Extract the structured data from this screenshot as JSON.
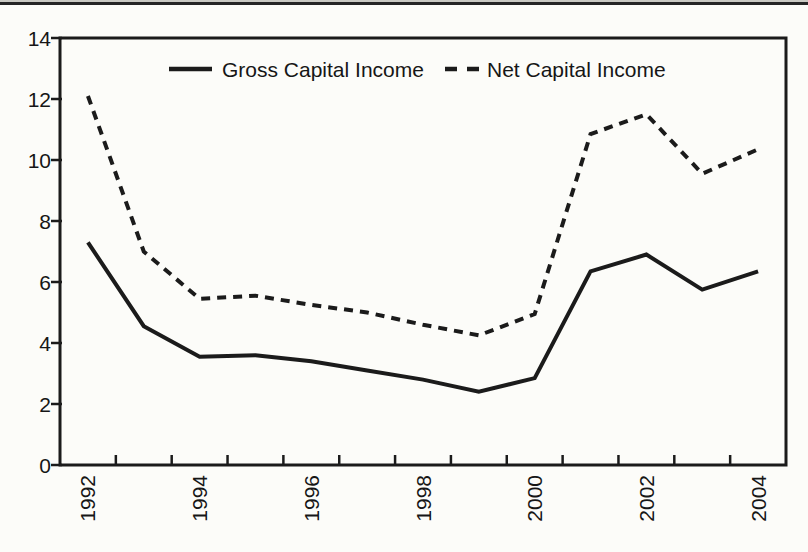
{
  "page": {
    "background": "#fcfcf9",
    "top_rule_color": "#262626"
  },
  "chart_data": {
    "type": "line",
    "title": "",
    "xlabel": "",
    "ylabel": "",
    "categories": [
      1992,
      1993,
      1994,
      1995,
      1996,
      1997,
      1998,
      1999,
      2000,
      2001,
      2002,
      2003,
      2004
    ],
    "series": [
      {
        "name": "Gross Capital Income",
        "style": "solid",
        "values": [
          7.3,
          4.55,
          3.55,
          3.6,
          3.4,
          3.1,
          2.8,
          2.4,
          2.85,
          6.35,
          6.9,
          5.75,
          6.35
        ]
      },
      {
        "name": "Net Capital Income",
        "style": "dashed",
        "values": [
          12.1,
          7.0,
          5.45,
          5.55,
          5.25,
          5.0,
          4.6,
          4.25,
          4.95,
          10.85,
          11.5,
          9.55,
          10.35
        ]
      }
    ],
    "ylim": [
      0,
      14
    ],
    "yticks": [
      0,
      2,
      4,
      6,
      8,
      10,
      12,
      14
    ],
    "xtick_labels": [
      "1992",
      "1994",
      "1996",
      "1998",
      "2000",
      "2002",
      "2004"
    ],
    "x_label_rotation_deg": 90,
    "grid": false,
    "legend_position": "top-inside",
    "line_color": "#1b1b1b",
    "axis_color": "#1b1b1b"
  }
}
